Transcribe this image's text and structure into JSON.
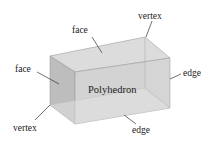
{
  "diagram": {
    "title": "Polyhedron",
    "labels": {
      "face_top": "face",
      "face_left": "face",
      "vertex_top": "vertex",
      "vertex_bottom": "vertex",
      "edge_right": "edge",
      "edge_bottom": "edge"
    },
    "colors": {
      "top_face": "#dcdcdc",
      "left_face": "#bdbdbd",
      "front_face": "#d0d0d0",
      "back_face": "#c8c8c8",
      "edge": "#9a9a9a",
      "leader": "#333333"
    }
  }
}
